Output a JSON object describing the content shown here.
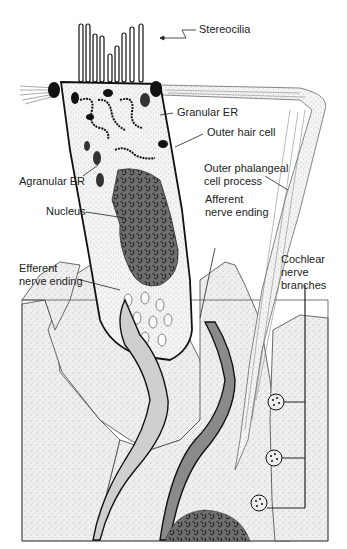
{
  "labels": {
    "stereocilia": "Stereocilia",
    "granular_er": "Granular ER",
    "outer_hair_cell": "Outer hair cell",
    "agranular_er": "Agranular ER",
    "outer_phalangeal_1": "Outer phalangeal",
    "outer_phalangeal_2": "cell process",
    "nucleus": "Nucleus",
    "afferent_1": "Afferent",
    "afferent_2": "nerve ending",
    "efferent_1": "Efferent",
    "efferent_2": "nerve ending",
    "cochlear_1": "Cochlear",
    "cochlear_2": "nerve",
    "cochlear_3": "branches"
  },
  "colors": {
    "stipple_fill": "#ebebeb",
    "outline": "#1a1a1a",
    "nucleus": "#6e6e6e",
    "efferent_fill": "#cfcfcf",
    "afferent_fill": "#8a8a8a",
    "organelle": "#111111"
  }
}
